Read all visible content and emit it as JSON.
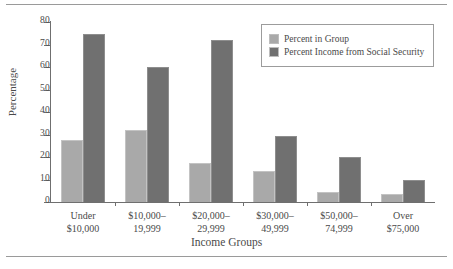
{
  "chart_data": {
    "type": "bar",
    "title": "",
    "xlabel": "Income Groups",
    "ylabel": "Percentage",
    "ylim": [
      0,
      80
    ],
    "yticks": [
      0,
      10,
      20,
      30,
      40,
      50,
      60,
      70,
      80
    ],
    "ytick_labels": [
      "0",
      "10",
      "20",
      "30",
      "40",
      "50",
      "60",
      "70",
      "80"
    ],
    "grid": false,
    "legend_position": "top-right",
    "categories": [
      "Under\n$10,000",
      "$10,000–\n19,999",
      "$20,000–\n29,999",
      "$30,000–\n49,999",
      "$50,000–\n74,999",
      "Over\n$75,000"
    ],
    "category_lines": [
      [
        "Under",
        "$10,000"
      ],
      [
        "$10,000–",
        "19,999"
      ],
      [
        "$20,000–",
        "29,999"
      ],
      [
        "$30,000–",
        "49,999"
      ],
      [
        "$50,000–",
        "74,999"
      ],
      [
        "Over",
        "$75,000"
      ]
    ],
    "series": [
      {
        "name": "Percent in Group",
        "color": "#a9a9a9",
        "values": [
          27.5,
          32,
          17.5,
          14,
          4.5,
          3.5
        ]
      },
      {
        "name": "Percent Income from Social Security",
        "color": "#707070",
        "values": [
          74.5,
          60,
          72,
          29.5,
          20,
          10
        ]
      }
    ]
  },
  "legend": {
    "items": [
      {
        "label": "Percent in Group",
        "color": "#a9a9a9"
      },
      {
        "label": "Percent Income from Social Security",
        "color": "#707070"
      }
    ]
  },
  "axes": {
    "y_title": "Percentage",
    "x_title": "Income Groups"
  }
}
